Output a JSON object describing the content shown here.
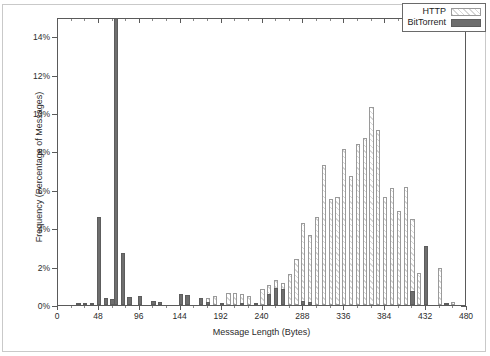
{
  "chart_data": {
    "type": "bar",
    "title": "",
    "xlabel": "Message Length (Bytes)",
    "ylabel": "Frequency (Percentage of Messages)",
    "xlim": [
      0,
      480
    ],
    "ylim": [
      0,
      15
    ],
    "grid": false,
    "legend_position": "top-right",
    "xticks": [
      0,
      48,
      96,
      144,
      192,
      240,
      288,
      336,
      384,
      432,
      480
    ],
    "xtick_labels": [
      "0",
      "48",
      "96",
      "144",
      "192",
      "240",
      "288",
      "336",
      "384",
      "432",
      "480"
    ],
    "yticks": [
      0,
      2,
      4,
      6,
      8,
      10,
      12,
      14
    ],
    "ytick_labels": [
      "0%",
      "2%",
      "4%",
      "6%",
      "8%",
      "10%",
      "12%",
      "14%"
    ],
    "note": "Values in percent of messages. Bars are binned by message length in bytes; bin width 8 bytes.",
    "series": [
      {
        "name": "BitTorrent",
        "color": "#6e6e6e",
        "fill": "solid",
        "points": [
          {
            "x": 24,
            "y": 0.12
          },
          {
            "x": 32,
            "y": 0.1
          },
          {
            "x": 40,
            "y": 0.12
          },
          {
            "x": 48,
            "y": 4.6
          },
          {
            "x": 56,
            "y": 0.35
          },
          {
            "x": 64,
            "y": 0.3
          },
          {
            "x": 68,
            "y": 15.2
          },
          {
            "x": 76,
            "y": 2.7
          },
          {
            "x": 84,
            "y": 0.4
          },
          {
            "x": 96,
            "y": 0.45
          },
          {
            "x": 112,
            "y": 0.2
          },
          {
            "x": 120,
            "y": 0.15
          },
          {
            "x": 144,
            "y": 0.55
          },
          {
            "x": 152,
            "y": 0.5
          },
          {
            "x": 168,
            "y": 0.35
          },
          {
            "x": 176,
            "y": 0.15
          },
          {
            "x": 192,
            "y": 0.12
          },
          {
            "x": 216,
            "y": 0.1
          },
          {
            "x": 232,
            "y": 0.1
          },
          {
            "x": 248,
            "y": 0.55
          },
          {
            "x": 256,
            "y": 0.9
          },
          {
            "x": 264,
            "y": 0.85
          },
          {
            "x": 288,
            "y": 0.2
          },
          {
            "x": 296,
            "y": 0.18
          },
          {
            "x": 416,
            "y": 0.75
          },
          {
            "x": 432,
            "y": 3.05
          },
          {
            "x": 456,
            "y": 0.08
          }
        ]
      },
      {
        "name": "HTTP",
        "color": "#d7d7d7",
        "fill": "hatched",
        "points": [
          {
            "x": 176,
            "y": 0.35
          },
          {
            "x": 184,
            "y": 0.45
          },
          {
            "x": 200,
            "y": 0.6
          },
          {
            "x": 208,
            "y": 0.65
          },
          {
            "x": 216,
            "y": 0.55
          },
          {
            "x": 224,
            "y": 0.45
          },
          {
            "x": 240,
            "y": 0.85
          },
          {
            "x": 248,
            "y": 1.05
          },
          {
            "x": 256,
            "y": 1.3
          },
          {
            "x": 264,
            "y": 1.15
          },
          {
            "x": 272,
            "y": 1.6
          },
          {
            "x": 280,
            "y": 2.4
          },
          {
            "x": 288,
            "y": 4.25
          },
          {
            "x": 296,
            "y": 3.65
          },
          {
            "x": 304,
            "y": 4.6
          },
          {
            "x": 312,
            "y": 7.3
          },
          {
            "x": 320,
            "y": 5.5
          },
          {
            "x": 328,
            "y": 5.6
          },
          {
            "x": 336,
            "y": 8.1
          },
          {
            "x": 344,
            "y": 6.7
          },
          {
            "x": 352,
            "y": 8.4
          },
          {
            "x": 360,
            "y": 8.7
          },
          {
            "x": 368,
            "y": 10.3
          },
          {
            "x": 376,
            "y": 9.1
          },
          {
            "x": 384,
            "y": 5.6
          },
          {
            "x": 392,
            "y": 6.1
          },
          {
            "x": 400,
            "y": 4.9
          },
          {
            "x": 408,
            "y": 6.15
          },
          {
            "x": 416,
            "y": 4.5
          },
          {
            "x": 424,
            "y": 1.65
          },
          {
            "x": 432,
            "y": 1.6
          },
          {
            "x": 448,
            "y": 1.95
          },
          {
            "x": 464,
            "y": 0.18
          }
        ]
      }
    ]
  },
  "legend": {
    "entries": [
      {
        "label": "HTTP",
        "style": "http"
      },
      {
        "label": "BitTorrent",
        "style": "bt"
      }
    ]
  }
}
